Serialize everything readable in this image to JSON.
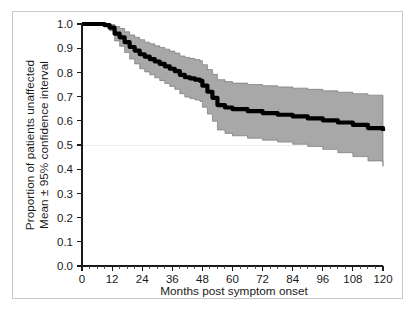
{
  "figure": {
    "background_color": "#ffffff",
    "frame_color": "#c9c9c9"
  },
  "chart_data": {
    "type": "line",
    "title": "",
    "subtitle": "",
    "xlabel": "Months post symptom onset",
    "ylabel_line1": "Proportion of patients unaffected",
    "ylabel_line2": "Mean ± 95% confidence interval",
    "xlim": [
      0,
      120
    ],
    "ylim": [
      0.0,
      1.0
    ],
    "grid": "horizontal-faint-at-0.5",
    "legend": "none",
    "x_ticks": [
      0,
      12,
      24,
      36,
      48,
      60,
      72,
      84,
      96,
      108,
      120
    ],
    "x_tick_labels": [
      "0",
      "12",
      "24",
      "36",
      "48",
      "60",
      "72",
      "84",
      "96",
      "108",
      "120"
    ],
    "x_minor_tick_interval": 3,
    "y_ticks": [
      0.0,
      0.1,
      0.2,
      0.3,
      0.4,
      0.5,
      0.6,
      0.7,
      0.8,
      0.9,
      1.0
    ],
    "y_tick_labels": [
      "0.0",
      "0.1",
      "0.2",
      "0.3",
      "0.4",
      "0.5",
      "0.6",
      "0.7",
      "0.8",
      "0.9",
      "1.0"
    ],
    "gridline_values": [
      0.5
    ],
    "colors": {
      "mean_line": "#000000",
      "confidence_band_fill": "#a8a8a8",
      "confidence_band_edge": "#6a6a6a",
      "axis": "#1a1a1a",
      "gridline": "#efefef"
    },
    "series": [
      {
        "name": "Mean proportion unaffected",
        "style": "step",
        "x": [
          0,
          6,
          9,
          11,
          13,
          15,
          17,
          19,
          21,
          23,
          25,
          27,
          29,
          31,
          33,
          35,
          37,
          39,
          41,
          43,
          45,
          47,
          48,
          50,
          52,
          54,
          57,
          60,
          66,
          72,
          78,
          84,
          90,
          96,
          102,
          108,
          114,
          120
        ],
        "values": [
          1.0,
          1.0,
          0.995,
          0.985,
          0.96,
          0.945,
          0.925,
          0.905,
          0.89,
          0.875,
          0.865,
          0.855,
          0.845,
          0.835,
          0.825,
          0.815,
          0.805,
          0.79,
          0.78,
          0.775,
          0.77,
          0.765,
          0.745,
          0.72,
          0.695,
          0.665,
          0.655,
          0.648,
          0.64,
          0.632,
          0.625,
          0.618,
          0.61,
          0.602,
          0.593,
          0.583,
          0.57,
          0.558
        ]
      },
      {
        "name": "Upper 95% confidence limit",
        "style": "step",
        "x": [
          0,
          6,
          9,
          11,
          13,
          15,
          17,
          19,
          21,
          23,
          25,
          27,
          29,
          31,
          33,
          35,
          37,
          39,
          41,
          43,
          45,
          47,
          48,
          50,
          52,
          54,
          57,
          60,
          66,
          72,
          78,
          84,
          90,
          96,
          102,
          108,
          114,
          120
        ],
        "values": [
          1.0,
          1.0,
          1.0,
          0.998,
          0.99,
          0.982,
          0.968,
          0.955,
          0.945,
          0.935,
          0.925,
          0.918,
          0.91,
          0.903,
          0.896,
          0.888,
          0.88,
          0.868,
          0.862,
          0.858,
          0.853,
          0.848,
          0.832,
          0.812,
          0.792,
          0.77,
          0.762,
          0.756,
          0.75,
          0.745,
          0.74,
          0.735,
          0.73,
          0.724,
          0.718,
          0.712,
          0.706,
          0.7
        ]
      },
      {
        "name": "Lower 95% confidence limit",
        "style": "step",
        "x": [
          0,
          6,
          9,
          11,
          13,
          15,
          17,
          19,
          21,
          23,
          25,
          27,
          29,
          31,
          33,
          35,
          37,
          39,
          41,
          43,
          45,
          47,
          48,
          50,
          52,
          54,
          57,
          60,
          66,
          72,
          78,
          84,
          90,
          96,
          102,
          108,
          114,
          120
        ],
        "values": [
          1.0,
          1.0,
          0.99,
          0.972,
          0.93,
          0.908,
          0.882,
          0.855,
          0.835,
          0.815,
          0.802,
          0.79,
          0.778,
          0.766,
          0.754,
          0.742,
          0.73,
          0.712,
          0.698,
          0.692,
          0.686,
          0.68,
          0.656,
          0.628,
          0.598,
          0.562,
          0.548,
          0.538,
          0.528,
          0.52,
          0.512,
          0.503,
          0.494,
          0.482,
          0.468,
          0.452,
          0.434,
          0.412
        ]
      }
    ]
  }
}
